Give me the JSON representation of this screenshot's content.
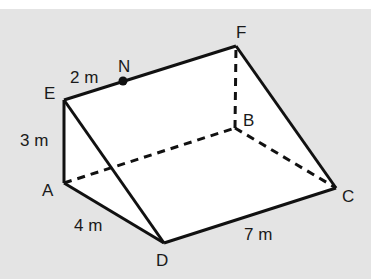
{
  "diagram": {
    "type": "triangular-prism",
    "colors": {
      "background": "#e4e4e4",
      "face": "#ffffff",
      "edge": "#111111"
    },
    "vertices": {
      "A": {
        "label": "A",
        "x": 64,
        "y": 183
      },
      "B": {
        "label": "B",
        "x": 235,
        "y": 128
      },
      "C": {
        "label": "C",
        "x": 336,
        "y": 188
      },
      "D": {
        "label": "D",
        "x": 164,
        "y": 243
      },
      "E": {
        "label": "E",
        "x": 64,
        "y": 100
      },
      "F": {
        "label": "F",
        "x": 236,
        "y": 46
      },
      "N": {
        "label": "N",
        "x": 123,
        "y": 81
      }
    },
    "solid_edges": [
      "AE",
      "AD",
      "DE",
      "EF",
      "FC",
      "DC"
    ],
    "hidden_edges": [
      "AB",
      "BF",
      "BC"
    ],
    "point_marker": "N",
    "measurements": [
      {
        "edge": "EN",
        "label": "2 m"
      },
      {
        "edge": "AE",
        "label": "3 m"
      },
      {
        "edge": "AD",
        "label": "4 m"
      },
      {
        "edge": "DC",
        "label": "7 m"
      }
    ]
  }
}
